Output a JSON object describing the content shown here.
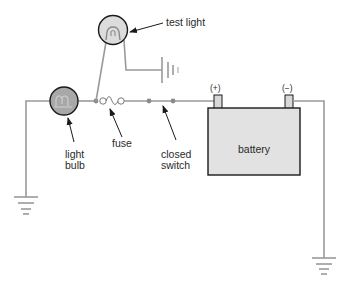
{
  "diagram": {
    "labels": {
      "test_light": "test light",
      "light_bulb_line1": "light",
      "light_bulb_line2": "bulb",
      "fuse": "fuse",
      "closed_switch_line1": "closed",
      "closed_switch_line2": "switch",
      "battery": "battery",
      "positive_terminal": "(+)",
      "negative_terminal": "(−)"
    },
    "colors": {
      "wire": "#9a9a9a",
      "light_bulb_fill": "#a8a8a8",
      "test_light_fill": "#dcdcdc",
      "battery_fill": "#e2e2e2",
      "outline": "#1a1a1a"
    }
  }
}
